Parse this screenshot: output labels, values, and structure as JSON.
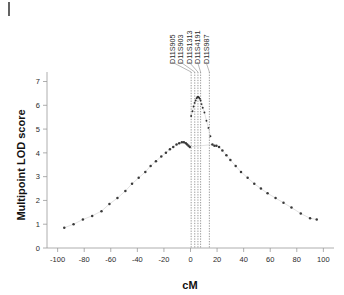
{
  "figure": {
    "corner_mark": "|"
  },
  "axes": {
    "x": {
      "label": "cM",
      "ticks": [
        -100,
        -80,
        -60,
        -40,
        -20,
        0,
        20,
        40,
        60,
        80,
        100
      ],
      "tick_labels": [
        "-100",
        "-80",
        "-60",
        "-40",
        "-20",
        "0",
        "20",
        "40",
        "60",
        "80",
        "100"
      ],
      "min": -108,
      "max": 108
    },
    "y": {
      "label": "Multipoint LOD score",
      "ticks": [
        0,
        1,
        2,
        3,
        4,
        5,
        6,
        7
      ],
      "tick_labels": [
        "0",
        "1",
        "2",
        "3",
        "4",
        "5",
        "6",
        "7"
      ],
      "min": 0,
      "max": 7.4
    }
  },
  "markers": [
    {
      "name": "D11S905",
      "cM": 0.5
    },
    {
      "name": "D11S903",
      "cM": 3.2
    },
    {
      "name": "D11S1313",
      "cM": 5.6
    },
    {
      "name": "D11S4191",
      "cM": 7.6
    },
    {
      "name": "D11S987",
      "cM": 14.2
    }
  ],
  "chart_data": {
    "type": "scatter",
    "title": "",
    "subtitle": "",
    "xlabel": "cM",
    "ylabel": "Multipoint LOD score",
    "xlim": [
      -108,
      108
    ],
    "ylim": [
      0,
      7.4
    ],
    "grid": false,
    "legend": null,
    "annotations": [
      {
        "text": "D11S905",
        "x": 0.5,
        "type": "marker-line"
      },
      {
        "text": "D11S903",
        "x": 3.2,
        "type": "marker-line"
      },
      {
        "text": "D11S1313",
        "x": 5.6,
        "type": "marker-line"
      },
      {
        "text": "D11S4191",
        "x": 7.6,
        "type": "marker-line"
      },
      {
        "text": "D11S987",
        "x": 14.2,
        "type": "marker-line"
      }
    ],
    "series": [
      {
        "name": "Multipoint LOD score",
        "x": [
          -95,
          -88,
          -81,
          -74,
          -67,
          -61,
          -55,
          -49,
          -44,
          -39,
          -34,
          -30,
          -26,
          -22,
          -18.5,
          -15.5,
          -13,
          -10.5,
          -8.5,
          -6.5,
          -5,
          -3.5,
          -2.5,
          -1.5,
          -0.5,
          0.5,
          1.5,
          2.3,
          3.1,
          3.9,
          4.6,
          5.2,
          5.8,
          6.4,
          7.0,
          7.6,
          8.3,
          9.2,
          10.5,
          12.0,
          13.5,
          15.0,
          16.5,
          18,
          19.5,
          21.5,
          24,
          27,
          30,
          34,
          38,
          43,
          48,
          53,
          58,
          64,
          70,
          76,
          83,
          90,
          95
        ],
        "values": [
          0.85,
          1.0,
          1.2,
          1.35,
          1.55,
          1.85,
          2.1,
          2.4,
          2.7,
          2.95,
          3.2,
          3.45,
          3.65,
          3.85,
          4.0,
          4.15,
          4.25,
          4.35,
          4.4,
          4.45,
          4.45,
          4.4,
          4.35,
          4.3,
          4.25,
          5.55,
          5.75,
          5.95,
          6.1,
          6.2,
          6.3,
          6.35,
          6.35,
          6.33,
          6.28,
          6.2,
          6.05,
          5.9,
          5.7,
          5.35,
          5.05,
          4.7,
          4.35,
          4.3,
          4.3,
          4.25,
          4.1,
          3.9,
          3.7,
          3.45,
          3.2,
          2.95,
          2.7,
          2.5,
          2.3,
          2.1,
          1.9,
          1.7,
          1.45,
          1.25,
          1.2
        ]
      }
    ]
  }
}
